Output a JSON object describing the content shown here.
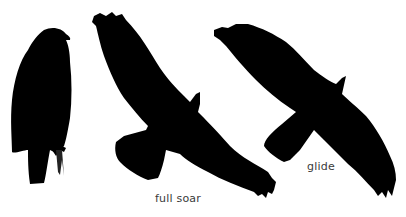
{
  "figure": {
    "background": "#ffffff",
    "silhouette_color": "#000000",
    "birds": [
      {
        "pose": "perched",
        "label": ""
      },
      {
        "pose": "full soar",
        "label": "full soar"
      },
      {
        "pose": "glide",
        "label": "glide"
      }
    ]
  },
  "labels": {
    "full_soar": "full soar",
    "glide": "glide"
  }
}
